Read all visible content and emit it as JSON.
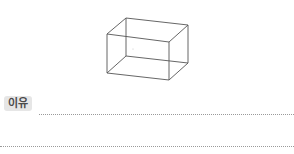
{
  "figure": {
    "type": "wireframe-cuboid",
    "stroke_color": "#555555",
    "front_face": [
      [
        107,
        34
      ],
      [
        169,
        42
      ],
      [
        169,
        80
      ],
      [
        107,
        73
      ]
    ],
    "back_face": [
      [
        126,
        18
      ],
      [
        188,
        25
      ],
      [
        188,
        63
      ],
      [
        126,
        56
      ]
    ]
  },
  "answer": {
    "label": "이유",
    "label_bg": "#e6e6e6",
    "lines": [
      {
        "value": ""
      },
      {
        "value": ""
      }
    ]
  }
}
